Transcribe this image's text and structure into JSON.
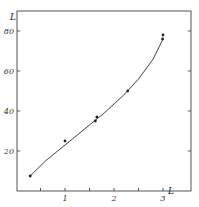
{
  "chart_data": {
    "type": "line",
    "title": "",
    "xlabel": "L",
    "ylabel": "L",
    "xlim": [
      0,
      3.5
    ],
    "ylim": [
      0,
      90
    ],
    "x_ticks": [
      1,
      2,
      3
    ],
    "x_tick_labels": [
      "1",
      "2",
      "3"
    ],
    "y_ticks": [
      20,
      40,
      60,
      80
    ],
    "y_tick_labels": [
      "20",
      "40",
      "60",
      "80"
    ],
    "grid": false,
    "legend": null,
    "series": [
      {
        "name": "measured points",
        "style": "markers",
        "x": [
          0.29,
          1.0,
          1.62,
          1.65,
          2.28,
          2.99,
          3.0
        ],
        "y": [
          7.5,
          25,
          35,
          37,
          50,
          76,
          78
        ]
      },
      {
        "name": "fitted curve",
        "style": "smooth-line",
        "x": [
          0.29,
          0.6,
          1.0,
          1.4,
          1.8,
          2.2,
          2.5,
          2.8,
          3.0
        ],
        "y": [
          7.5,
          15,
          23,
          31,
          39,
          48,
          56,
          66,
          76
        ]
      }
    ]
  },
  "axes": {
    "x_title": "L",
    "y_title": "L"
  }
}
